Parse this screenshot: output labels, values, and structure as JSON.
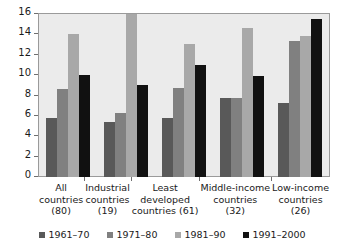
{
  "chart_data": {
    "type": "bar",
    "title": "",
    "subtitle": "",
    "xlabel": "",
    "ylabel": "",
    "ylim": [
      0,
      16
    ],
    "yticks": [
      0,
      2,
      4,
      6,
      8,
      10,
      12,
      14,
      16
    ],
    "ytick_labels": [
      "0",
      "2",
      "4",
      "6",
      "8",
      "10",
      "12",
      "14",
      "16"
    ],
    "grid": false,
    "legend_position": "bottom",
    "categories": [
      "All countries (80)",
      "Industrial countries (19)",
      "Least developed countries (61)",
      "Middle-income countries (32)",
      "Low-income countries (26)"
    ],
    "category_lines": [
      [
        "All",
        "countries",
        "(80)"
      ],
      [
        "Industrial",
        "countries",
        "(19)"
      ],
      [
        "Least",
        "developed",
        "countries (61)"
      ],
      [
        "Middle-income",
        "countries",
        "(32)"
      ],
      [
        "Low-income",
        "countries",
        "(26)"
      ]
    ],
    "series": [
      {
        "name": "1961–70",
        "color": "#595959",
        "values": [
          5.8,
          5.4,
          5.8,
          7.8,
          7.3
        ]
      },
      {
        "name": "1971–80",
        "color": "#808080",
        "values": [
          8.6,
          6.3,
          8.7,
          7.75,
          13.4
        ]
      },
      {
        "name": "1981–90",
        "color": "#a8a8a8",
        "values": [
          14.0,
          16.0,
          13.1,
          14.6,
          13.8
        ]
      },
      {
        "name": "1991–2000",
        "color": "#111111",
        "values": [
          10.0,
          9.0,
          11.0,
          9.9,
          15.5
        ]
      }
    ],
    "plot_background": "#ebebeb",
    "figure_background": "#ffffff",
    "axis_color": "#9a9a9a"
  }
}
